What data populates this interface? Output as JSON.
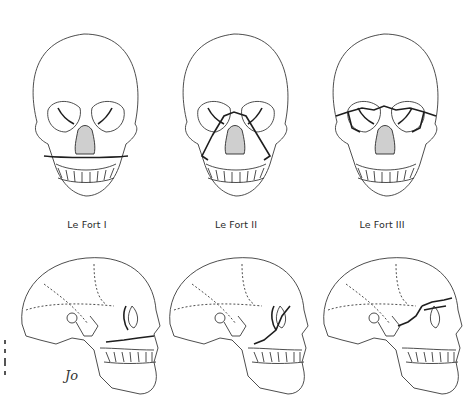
{
  "figure": {
    "views": [
      "frontal",
      "lateral"
    ],
    "columns": [
      {
        "label": "Le Fort I",
        "fracture_level": "horizontal maxillary, above teeth"
      },
      {
        "label": "Le Fort II",
        "fracture_level": "pyramidal, through nasal bones and orbits"
      },
      {
        "label": "Le Fort III",
        "fracture_level": "craniofacial disjunction, through orbits and zygomatic arches"
      }
    ],
    "signature": "Jo",
    "colors": {
      "line": "#3a3a3a",
      "fracture": "#1e1e1e",
      "background": "#ffffff"
    }
  }
}
